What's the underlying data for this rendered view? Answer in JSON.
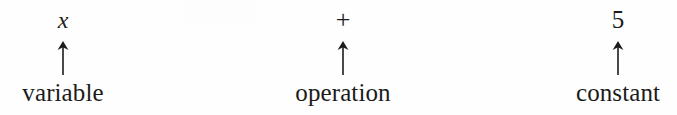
{
  "diagram": {
    "expression": "x + 5",
    "background_color": "#fefefe",
    "text_color": "#1b1b1b",
    "columns": [
      {
        "symbol": "x",
        "symbol_style": "italic",
        "arrow": "up-arrow",
        "label": "variable"
      },
      {
        "symbol": "+",
        "symbol_style": "roman",
        "arrow": "up-arrow",
        "label": "operation"
      },
      {
        "symbol": "5",
        "symbol_style": "roman",
        "arrow": "up-arrow",
        "label": "constant"
      }
    ]
  }
}
